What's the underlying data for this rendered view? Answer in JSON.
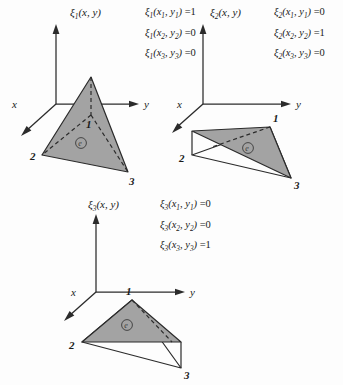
{
  "figure": {
    "caption": "",
    "element_label": "e",
    "axes": {
      "vertical": "",
      "horizontal": "y",
      "depth": "x"
    },
    "node_labels": [
      "1",
      "2",
      "3"
    ]
  },
  "panels": [
    {
      "id": "panel-1",
      "title": "ξ₁(x, y)",
      "title_base": "ξ",
      "title_sub": "1",
      "title_args": "(x, y)",
      "equations": [
        {
          "base": "ξ",
          "sub": "1",
          "args_x": "x",
          "args_x_sub": "1",
          "args_y": "y",
          "args_y_sub": "1",
          "value": "=1"
        },
        {
          "base": "ξ",
          "sub": "1",
          "args_x": "x",
          "args_x_sub": "2",
          "args_y": "y",
          "args_y_sub": "2",
          "value": "=0"
        },
        {
          "base": "ξ",
          "sub": "1",
          "args_x": "x",
          "args_x_sub": "3",
          "args_y": "y",
          "args_y_sub": "3",
          "value": "=0"
        }
      ],
      "raised_node": "1",
      "element_label": "e",
      "axis_y": "y",
      "axis_x": "x",
      "node1": "1",
      "node2": "2",
      "node3": "3"
    },
    {
      "id": "panel-2",
      "title": "ξ₂(x, y)",
      "title_base": "ξ",
      "title_sub": "2",
      "title_args": "(x, y)",
      "equations": [
        {
          "base": "ξ",
          "sub": "2",
          "args_x": "x",
          "args_x_sub": "1",
          "args_y": "y",
          "args_y_sub": "1",
          "value": "=0"
        },
        {
          "base": "ξ",
          "sub": "2",
          "args_x": "x",
          "args_x_sub": "2",
          "args_y": "y",
          "args_y_sub": "2",
          "value": "=1"
        },
        {
          "base": "ξ",
          "sub": "2",
          "args_x": "x",
          "args_x_sub": "3",
          "args_y": "y",
          "args_y_sub": "3",
          "value": "=0"
        }
      ],
      "raised_node": "2",
      "element_label": "e",
      "axis_y": "y",
      "axis_x": "x",
      "node1": "1",
      "node2": "2",
      "node3": "3"
    },
    {
      "id": "panel-3",
      "title": "ξ₃(x, y)",
      "title_base": "ξ",
      "title_sub": "3",
      "title_args": "(x, y)",
      "equations": [
        {
          "base": "ξ",
          "sub": "3",
          "args_x": "x",
          "args_x_sub": "1",
          "args_y": "y",
          "args_y_sub": "1",
          "value": "=0"
        },
        {
          "base": "ξ",
          "sub": "3",
          "args_x": "x",
          "args_x_sub": "2",
          "args_y": "y",
          "args_y_sub": "2",
          "value": "=0"
        },
        {
          "base": "ξ",
          "sub": "3",
          "args_x": "x",
          "args_x_sub": "3",
          "args_y": "y",
          "args_y_sub": "3",
          "value": "=1"
        }
      ],
      "raised_node": "3",
      "element_label": "e",
      "axis_y": "y",
      "axis_x": "x",
      "node1": "1",
      "node2": "2",
      "node3": "3"
    }
  ]
}
